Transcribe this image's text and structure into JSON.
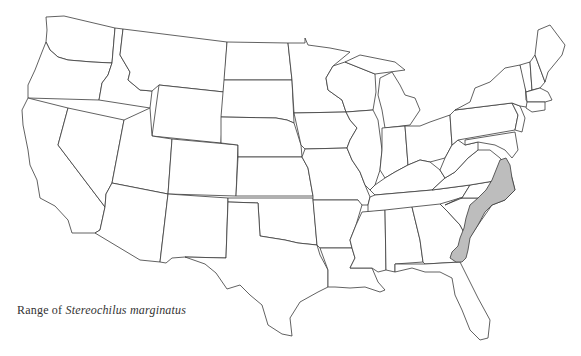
{
  "caption": {
    "prefix": "Range of",
    "species": "Stereochilus marginatus"
  },
  "map": {
    "region": "Contiguous United States",
    "outline_color": "#3a3a3a",
    "range_fill": "#bdbdbd",
    "background": "#ffffff",
    "shaded_range_states": [
      "Virginia (southeast)",
      "North Carolina (east)",
      "South Carolina (east)",
      "Georgia (southeast coast)"
    ]
  }
}
